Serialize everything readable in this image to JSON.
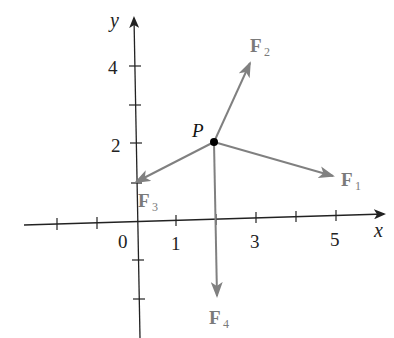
{
  "figure": {
    "axes": {
      "x_label": "x",
      "y_label": "y",
      "x_tick_labels": [
        "0",
        "1",
        "3",
        "5"
      ],
      "y_tick_labels": [
        "4",
        "2"
      ],
      "x_ticks": [
        -2,
        -1,
        1,
        2,
        3,
        4,
        5
      ],
      "y_ticks": [
        -2,
        -1,
        1,
        2,
        3,
        4
      ]
    },
    "point": {
      "label": "P",
      "x": 2,
      "y": 2
    },
    "vectors": [
      {
        "name": "F",
        "sub": "1",
        "from": [
          2,
          2
        ],
        "to": [
          5,
          1.4
        ]
      },
      {
        "name": "F",
        "sub": "2",
        "from": [
          2,
          2
        ],
        "to": [
          3,
          4
        ]
      },
      {
        "name": "F",
        "sub": "3",
        "from": [
          2,
          2
        ],
        "to": [
          0,
          1
        ]
      },
      {
        "name": "F",
        "sub": "4",
        "from": [
          2,
          2
        ],
        "to": [
          2,
          -2
        ]
      }
    ],
    "colors": {
      "axis": "#222222",
      "vector": "#808080",
      "point": "#000000",
      "vector_label": "#7a7a7a"
    }
  }
}
